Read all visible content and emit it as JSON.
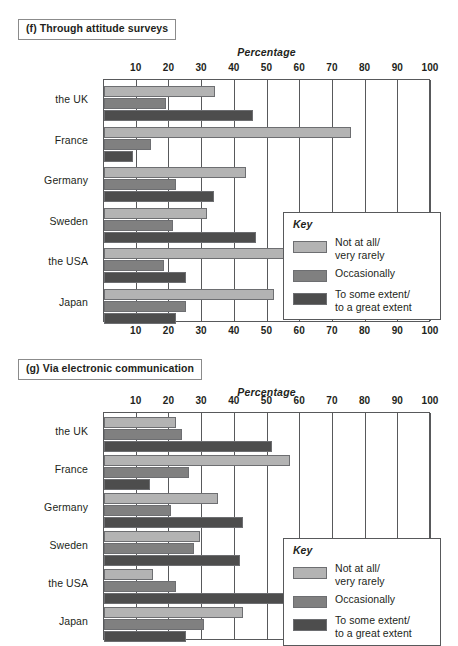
{
  "chart_data": [
    {
      "id": "f",
      "type": "bar",
      "orientation": "horizontal",
      "title": "(f) Through attitude surveys",
      "xlabel": "Percentage",
      "ylabel": "",
      "xlim": [
        0,
        100
      ],
      "xticks": [
        10,
        20,
        30,
        40,
        50,
        60,
        70,
        80,
        90,
        100
      ],
      "grid": true,
      "legend_position": "inside-right",
      "legend_title": "Key",
      "categories": [
        "the UK",
        "France",
        "Germany",
        "Sweden",
        "the USA",
        "Japan"
      ],
      "series": [
        {
          "name": "Not at all/\nvery rarely",
          "color": "#b3b3b3",
          "values": [
            34,
            75.5,
            43.5,
            31.5,
            55.5,
            52
          ]
        },
        {
          "name": "Occasionally",
          "color": "#808080",
          "values": [
            19,
            14.5,
            22,
            21,
            18.5,
            25
          ]
        },
        {
          "name": "To some extent/\nto a great extent",
          "color": "#4d4d4d",
          "values": [
            45.5,
            9,
            33.5,
            46.5,
            25,
            22
          ]
        }
      ]
    },
    {
      "id": "g",
      "type": "bar",
      "orientation": "horizontal",
      "title": "(g) Via electronic communication",
      "xlabel": "Percentage",
      "ylabel": "",
      "xlim": [
        0,
        100
      ],
      "xticks": [
        10,
        20,
        30,
        40,
        50,
        60,
        70,
        80,
        90,
        100
      ],
      "grid": true,
      "legend_position": "inside-right",
      "legend_title": "Key",
      "categories": [
        "the UK",
        "France",
        "Germany",
        "Sweden",
        "the USA",
        "Japan"
      ],
      "series": [
        {
          "name": "Not at all/\nvery rarely",
          "color": "#b3b3b3",
          "values": [
            22,
            57,
            35,
            29.5,
            15,
            42.5
          ]
        },
        {
          "name": "Occasionally",
          "color": "#808080",
          "values": [
            24,
            26,
            20.5,
            27.5,
            22,
            30.5
          ]
        },
        {
          "name": "To some extent/\nto a great extent",
          "color": "#4d4d4d",
          "values": [
            51.5,
            14,
            42.5,
            41.5,
            61,
            25
          ]
        }
      ]
    }
  ],
  "panel_f": {
    "title": "(f) Through attitude surveys",
    "axis_title": "Percentage"
  },
  "panel_g": {
    "title": "(g) Via electronic communication",
    "axis_title": "Percentage"
  },
  "legend": {
    "title": "Key",
    "items": [
      {
        "label": "Not at all/\nvery rarely",
        "color": "#b3b3b3"
      },
      {
        "label": "Occasionally",
        "color": "#808080"
      },
      {
        "label": "To some extent/\nto a great extent",
        "color": "#4d4d4d"
      }
    ]
  }
}
